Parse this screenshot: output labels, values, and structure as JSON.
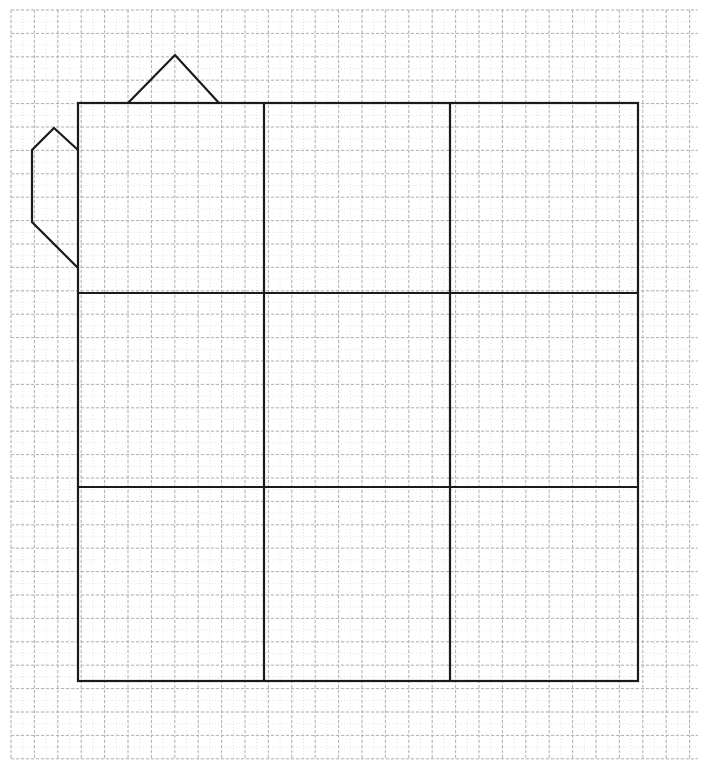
{
  "canvas": {
    "width": 709,
    "height": 783,
    "background_color": "#ffffff",
    "title": "Teapot outline on graph paper"
  },
  "grid": {
    "name": "graph-paper-grid",
    "minor_spacing_px": 11.7,
    "major_spacing_px": 23.4,
    "origin_x": 11,
    "origin_y": 10,
    "extent_x": 698,
    "extent_y": 760,
    "minor_color": "#d9d9dd",
    "major_color": "#a8a8b0",
    "minor_dash": "1 2",
    "major_dash": "3 2",
    "minor_width": 0.7,
    "major_width": 0.9
  },
  "figure": {
    "name": "teapot-figure",
    "stroke_color": "#1a1a1a",
    "stroke_width": 2.2,
    "fill": "none",
    "parts": [
      {
        "name": "body-square",
        "label": "Main body 3x3 square",
        "type": "rect",
        "x": 78,
        "y": 103,
        "width": 560,
        "height": 578
      },
      {
        "name": "body-grid-vertical-1",
        "label": "First inner vertical divider",
        "type": "line",
        "x1": 264,
        "y1": 103,
        "x2": 264,
        "y2": 681
      },
      {
        "name": "body-grid-vertical-2",
        "label": "Second inner vertical divider",
        "type": "line",
        "x1": 450,
        "y1": 103,
        "x2": 450,
        "y2": 681
      },
      {
        "name": "body-grid-horizontal-1",
        "label": "First inner horizontal divider",
        "type": "line",
        "x1": 78,
        "y1": 293,
        "x2": 638,
        "y2": 293
      },
      {
        "name": "body-grid-horizontal-2",
        "label": "Second inner horizontal divider",
        "type": "line",
        "x1": 78,
        "y1": 487,
        "x2": 638,
        "y2": 487
      },
      {
        "name": "lid-triangle",
        "label": "Triangular lid on top",
        "type": "polyline",
        "points": "128,103 175,55 219,103"
      },
      {
        "name": "spout-outline",
        "label": "Spout / handle on the left side",
        "type": "polyline",
        "points": "78,150 54,128 32,150 32,222 78,268"
      }
    ]
  },
  "legend": {
    "visible": false,
    "entries": []
  },
  "chart_data": {
    "type": "table",
    "categories": [],
    "values": [],
    "annotations": []
  }
}
